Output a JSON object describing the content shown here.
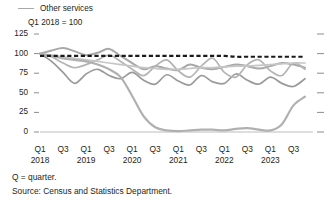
{
  "legend": {
    "items": [
      {
        "label": "Other services",
        "color": "#a8a8a8",
        "icon": "line-swatch-icon"
      }
    ]
  },
  "axis_note": "Q1 2018 = 100",
  "footnotes": {
    "quarter_note": "Q = quarter.",
    "source": "Source: Census and Statistics Department."
  },
  "chart_data": {
    "type": "line",
    "title": "",
    "subtitle": "",
    "xlabel": "",
    "ylabel": "",
    "note": "Q1 2018 = 100",
    "ylim": [
      0,
      125
    ],
    "yticks": [
      0,
      25,
      50,
      75,
      100,
      125
    ],
    "ytick_labels": [
      "0",
      "25",
      "50",
      "75",
      "100",
      "125"
    ],
    "grid": false,
    "legend_position": "top-left",
    "x": [
      "Q1 2018",
      "Q2 2018",
      "Q3 2018",
      "Q4 2018",
      "Q1 2019",
      "Q2 2019",
      "Q3 2019",
      "Q4 2019",
      "Q1 2020",
      "Q2 2020",
      "Q3 2020",
      "Q4 2020",
      "Q1 2021",
      "Q2 2021",
      "Q3 2021",
      "Q4 2021",
      "Q1 2022",
      "Q2 2022",
      "Q3 2022",
      "Q4 2022",
      "Q1 2023",
      "Q2 2023",
      "Q3 2023",
      "Q4 2023"
    ],
    "xtick_labels": [
      "Q1",
      "Q3",
      "Q1",
      "Q3",
      "Q1",
      "Q3",
      "Q1",
      "Q3",
      "Q1",
      "Q3",
      "Q1",
      "Q3"
    ],
    "xtick_years": [
      "2018",
      "2019",
      "2020",
      "2021",
      "2022",
      "2023"
    ],
    "series": [
      {
        "name": "Other services",
        "color": "#a8a8a8",
        "width": 2.0,
        "values": [
          100,
          104,
          107,
          103,
          98,
          101,
          106,
          97,
          88,
          80,
          84,
          81,
          79,
          86,
          82,
          80,
          83,
          86,
          84,
          81,
          84,
          88,
          86,
          82
        ]
      },
      {
        "name": "Series 2",
        "color": "#9a9a9a",
        "width": 1.7,
        "values": [
          100,
          90,
          76,
          62,
          74,
          80,
          72,
          68,
          76,
          66,
          61,
          73,
          65,
          60,
          72,
          64,
          62,
          74,
          66,
          61,
          70,
          62,
          58,
          68
        ]
      },
      {
        "name": "Series 3",
        "color": "#b4b4b4",
        "width": 1.7,
        "values": [
          100,
          96,
          88,
          82,
          86,
          92,
          98,
          90,
          80,
          72,
          84,
          92,
          78,
          70,
          84,
          94,
          76,
          70,
          86,
          92,
          78,
          72,
          88,
          80
        ]
      },
      {
        "name": "Series 4",
        "color": "#c6c6c6",
        "width": 1.7,
        "values": [
          100,
          98,
          96,
          94,
          92,
          90,
          88,
          86,
          84,
          82,
          81,
          80,
          80,
          81,
          82,
          82,
          83,
          84,
          84,
          85,
          86,
          87,
          88,
          88
        ]
      },
      {
        "name": "Series 5",
        "color": "#b0b0b0",
        "width": 2.2,
        "values": [
          100,
          97,
          94,
          92,
          90,
          86,
          80,
          70,
          46,
          20,
          6,
          2,
          1,
          2,
          3,
          3,
          2,
          4,
          5,
          3,
          2,
          10,
          34,
          45
        ]
      },
      {
        "name": "Reference line",
        "color": "#1a1a1a",
        "width": 2.2,
        "dashed": true,
        "values": [
          97,
          97,
          97,
          97,
          97,
          97,
          97,
          97,
          97,
          97,
          97,
          97,
          97,
          97,
          97,
          97,
          97,
          96,
          96,
          96,
          96,
          96,
          96,
          96
        ]
      }
    ]
  }
}
